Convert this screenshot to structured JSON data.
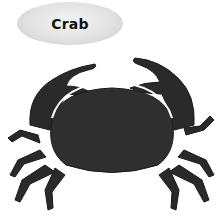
{
  "label": {
    "text": "Crab"
  },
  "image": {
    "subject": "crab-illustration",
    "colors": {
      "body": "#2a2a2a",
      "shade": "#444444",
      "highlight": "#ffffff",
      "label_bg": "#dcdcdc"
    }
  }
}
